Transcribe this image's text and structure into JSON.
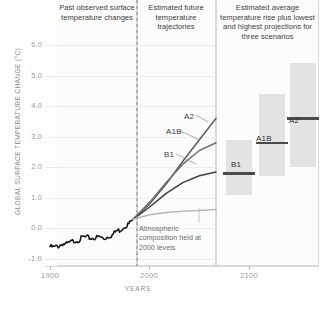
{
  "panels": {
    "past": {
      "title": "Past observed surface temperature changes"
    },
    "future": {
      "title": "Estimated future temperature trajectories"
    },
    "average": {
      "title": "Estimated average temperature rise plus lowest and highest projections for three scenarios"
    }
  },
  "annotation": "Atmospheric composition held at 2000 levels",
  "axis": {
    "y_label": "GLOBAL SURFACE TEMPERATURE CHANGE (°C)",
    "x_label": "YEARS",
    "y_ticks": [
      "6.0",
      "5.0",
      "4.0",
      "3.0",
      "2.0",
      "1.0",
      "0.0",
      "-1.0"
    ],
    "x_ticks": [
      "1900",
      "2000",
      "2100"
    ]
  },
  "line_labels": {
    "a2": "A2",
    "a1b": "A1B",
    "b1": "B1"
  },
  "bar_labels": {
    "b1": "B1",
    "a1b": "A1B",
    "a2": "A2"
  },
  "colors": {
    "observed": "#101010",
    "a2": "#5a5a5a",
    "a1b": "#6f6f6f",
    "b1": "#3f3f3f",
    "constant": "#b9b9b9",
    "bar_range": "#e3e3e3",
    "bar_mean": "#4a4a4a",
    "grid": "#ececec",
    "divider": "#8a8a8a"
  },
  "chart_data": {
    "type": "line",
    "xlabel": "YEARS",
    "ylabel": "GLOBAL SURFACE TEMPERATURE CHANGE (°C)",
    "xlim": [
      1900,
      2100
    ],
    "ylim": [
      -1.0,
      6.0
    ],
    "grid": true,
    "legend": "inline-labels",
    "divider_year": 2000,
    "series": [
      {
        "name": "Observed surface temperature change",
        "color": "#101010",
        "x": [
          1900,
          1905,
          1910,
          1915,
          1920,
          1925,
          1930,
          1935,
          1940,
          1945,
          1950,
          1955,
          1960,
          1965,
          1970,
          1975,
          1980,
          1985,
          1990,
          1995,
          2000
        ],
        "values": [
          -0.6,
          -0.62,
          -0.58,
          -0.5,
          -0.52,
          -0.45,
          -0.4,
          -0.38,
          -0.28,
          -0.3,
          -0.32,
          -0.3,
          -0.28,
          -0.34,
          -0.26,
          -0.22,
          -0.08,
          -0.05,
          0.08,
          0.14,
          0.3
        ]
      },
      {
        "name": "A2",
        "color": "#5a5a5a",
        "x": [
          2000,
          2020,
          2040,
          2060,
          2080,
          2100
        ],
        "values": [
          0.3,
          0.8,
          1.45,
          2.2,
          2.9,
          3.6
        ]
      },
      {
        "name": "A1B",
        "color": "#6f6f6f",
        "x": [
          2000,
          2020,
          2040,
          2060,
          2080,
          2100
        ],
        "values": [
          0.3,
          0.85,
          1.5,
          2.1,
          2.55,
          2.8
        ]
      },
      {
        "name": "B1",
        "color": "#3f3f3f",
        "x": [
          2000,
          2020,
          2040,
          2060,
          2080,
          2100
        ],
        "values": [
          0.3,
          0.7,
          1.15,
          1.5,
          1.72,
          1.85
        ]
      },
      {
        "name": "Year 2000 constant concentrations",
        "color": "#b9b9b9",
        "x": [
          2000,
          2020,
          2040,
          2060,
          2080,
          2100
        ],
        "values": [
          0.3,
          0.45,
          0.52,
          0.56,
          0.59,
          0.62
        ]
      }
    ],
    "bars": {
      "type": "range-with-mean",
      "categories": [
        "B1",
        "A1B",
        "A2"
      ],
      "mean": [
        1.8,
        2.8,
        3.6
      ],
      "low": [
        1.1,
        1.7,
        2.0
      ],
      "high": [
        2.9,
        4.4,
        5.4
      ]
    }
  }
}
